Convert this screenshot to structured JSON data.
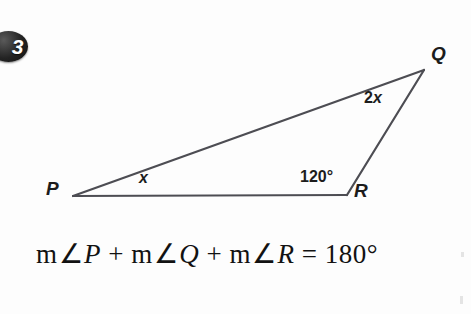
{
  "problem": {
    "number": "3"
  },
  "diagram": {
    "type": "triangle",
    "shape_name": "triangle-PQR",
    "stroke_color": "#4d4d53",
    "stroke_width": 2.2,
    "vertices": [
      {
        "name": "P",
        "label": "P",
        "x": 73,
        "y": 196
      },
      {
        "name": "Q",
        "label": "Q",
        "x": 424,
        "y": 70
      },
      {
        "name": "R",
        "label": "R",
        "x": 347,
        "y": 195
      }
    ],
    "sides": [
      {
        "from": "P",
        "to": "Q"
      },
      {
        "from": "Q",
        "to": "R"
      },
      {
        "from": "P",
        "to": "R"
      }
    ],
    "angle_labels": [
      {
        "name": "angle-P",
        "at_vertex": "P",
        "text": "x",
        "italic": true
      },
      {
        "name": "angle-Q",
        "at_vertex": "Q",
        "text": "2x",
        "italic": false
      },
      {
        "name": "angle-R",
        "at_vertex": "R",
        "text": "120°",
        "italic": false
      }
    ],
    "angle_P_expression": "x",
    "angle_Q_expression": "2x",
    "angle_R_value": "120°"
  },
  "equation": {
    "m_prefix": "m",
    "angle_symbol": "∠",
    "plus": "+",
    "equals": "=",
    "term_1_var": "P",
    "term_2_var": "Q",
    "term_3_var": "R",
    "result": "180°",
    "full_text": "m∠P + m∠Q + m∠R = 180°"
  }
}
